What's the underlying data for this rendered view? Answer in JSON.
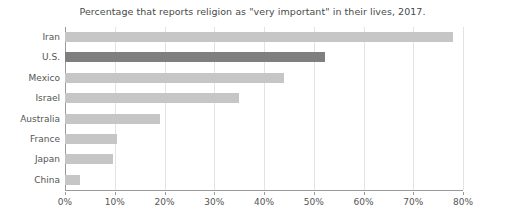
{
  "chart_data": {
    "type": "bar",
    "orientation": "horizontal",
    "title": "Percentage that reports religion as \"very important\" in their lives, 2017.",
    "xlabel": "",
    "ylabel": "",
    "xlim": [
      0,
      80
    ],
    "xtick_values": [
      0,
      10,
      20,
      30,
      40,
      50,
      60,
      70,
      80
    ],
    "xtick_labels": [
      "0%",
      "10%",
      "20%",
      "30%",
      "40%",
      "50%",
      "60%",
      "70%",
      "80%"
    ],
    "grid": true,
    "grid_axis": "x",
    "legend": false,
    "categories": [
      "Iran",
      "U.S.",
      "Mexico",
      "Israel",
      "Australia",
      "France",
      "Japan",
      "China"
    ],
    "values": [
      78,
      52.3,
      44,
      35,
      19,
      10.5,
      9.6,
      3
    ],
    "highlight_category": "U.S.",
    "colors": {
      "bar": "#c6c6c6",
      "bar_highlight": "#7f7f7f",
      "grid": "#e3e3e3",
      "axis": "#9a9a9a",
      "text": "#555555",
      "title_text": "#4a4a4a",
      "background": "#ffffff"
    }
  }
}
